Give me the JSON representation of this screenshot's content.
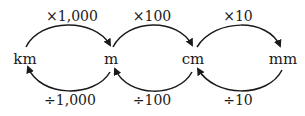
{
  "units": [
    {
      "id": "km",
      "label": "km"
    },
    {
      "id": "m",
      "label": "m"
    },
    {
      "id": "cm",
      "label": "cm"
    },
    {
      "id": "mm",
      "label": "mm"
    }
  ],
  "forward_conversions": [
    {
      "from": "km",
      "to": "m",
      "label": "×1,000"
    },
    {
      "from": "m",
      "to": "cm",
      "label": "×100"
    },
    {
      "from": "cm",
      "to": "mm",
      "label": "×10"
    }
  ],
  "backward_conversions": [
    {
      "from": "m",
      "to": "km",
      "label": "÷1,000"
    },
    {
      "from": "cm",
      "to": "m",
      "label": "÷100"
    },
    {
      "from": "mm",
      "to": "cm",
      "label": "÷10"
    }
  ],
  "colors": {
    "stroke": "#1a1a1a",
    "background": "#ffffff"
  }
}
